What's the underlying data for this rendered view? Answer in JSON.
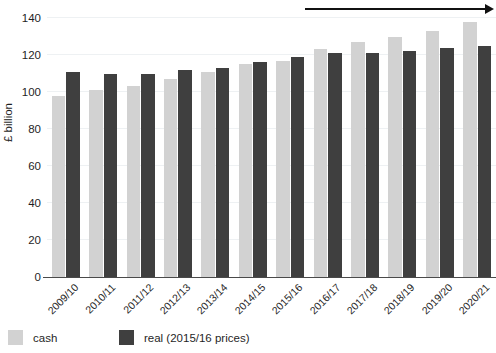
{
  "chart_data": {
    "type": "bar",
    "title": "",
    "subtitle": "",
    "xlabel": "",
    "ylabel": "£ billion",
    "ylim": [
      0,
      140
    ],
    "yticks": [
      0,
      20,
      40,
      60,
      80,
      100,
      120,
      140
    ],
    "ytick_labels": [
      "0",
      "20",
      "40",
      "60",
      "80",
      "100",
      "120",
      "140"
    ],
    "grid": true,
    "legend_position": "bottom-left",
    "categories": [
      "2009/10",
      "2010/11",
      "2011/12",
      "2012/13",
      "2013/14",
      "2014/15",
      "2015/16",
      "2016/17",
      "2017/18",
      "2018/19",
      "2019/20",
      "2020/21"
    ],
    "series": [
      {
        "name": "cash",
        "color": "#d2d2d2",
        "values": [
          98,
          101,
          103,
          107,
          111,
          115,
          117,
          123,
          127,
          130,
          133,
          138
        ]
      },
      {
        "name": "real (2015/16 prices)",
        "color": "#3f3f3f",
        "values": [
          111,
          110,
          110,
          112,
          113,
          116,
          119,
          121,
          121,
          122,
          124,
          125
        ]
      }
    ],
    "annotations": [
      {
        "name": "planned-range",
        "label": "Planned",
        "style": "arrow",
        "from_category": "2016/17",
        "to_category": "2020/21"
      }
    ]
  },
  "legend": {
    "items": [
      {
        "label": "cash",
        "color": "#d2d2d2"
      },
      {
        "label": "real (2015/16 prices)",
        "color": "#3f3f3f"
      }
    ]
  },
  "axes": {
    "y_title": "£ billion"
  },
  "annotation": {
    "planned_label": "Planned"
  }
}
